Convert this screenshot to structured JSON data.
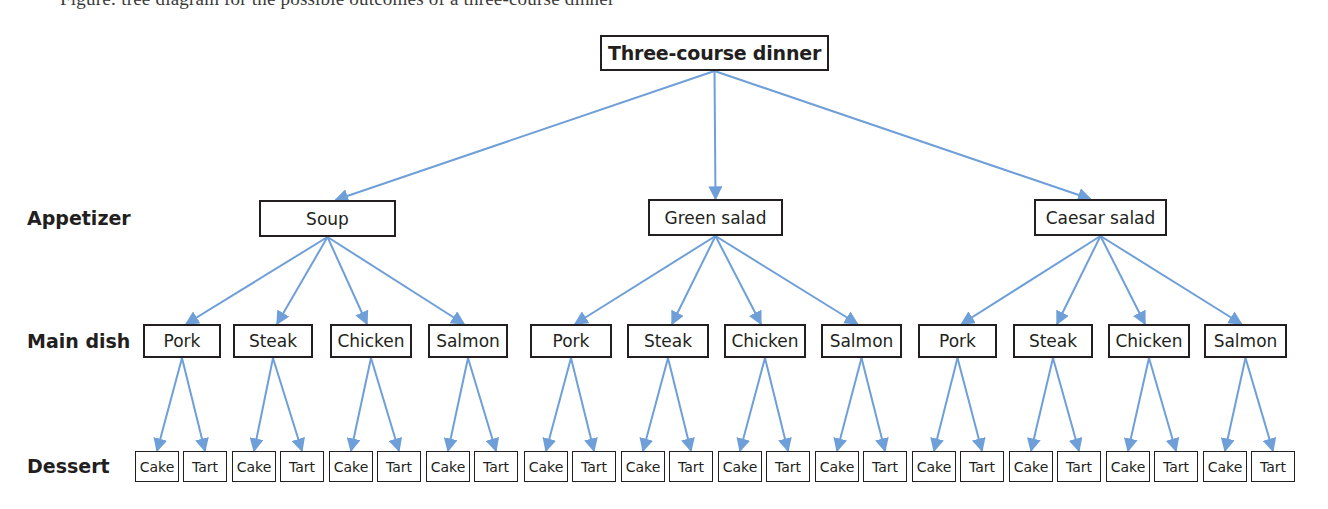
{
  "caption_cutoff": "Figure: tree diagram for the possible outcomes of a three-course dinner",
  "root": {
    "label": "Three-course dinner",
    "x": 600,
    "y": 35,
    "w": 229,
    "h": 36
  },
  "level_labels": [
    {
      "label": "Appetizer",
      "y": 218
    },
    {
      "label": "Main dish",
      "y": 341
    },
    {
      "label": "Dessert",
      "y": 466
    }
  ],
  "appetizers": [
    {
      "label": "Soup",
      "x": 259,
      "y": 200,
      "w": 137,
      "h": 37
    },
    {
      "label": "Green salad",
      "x": 648,
      "y": 199,
      "w": 135,
      "h": 37
    },
    {
      "label": "Caesar salad",
      "x": 1034,
      "y": 199,
      "w": 133,
      "h": 37
    }
  ],
  "main_dish_options": [
    "Pork",
    "Steak",
    "Chicken",
    "Salmon"
  ],
  "dessert_options": [
    "Cake",
    "Tart"
  ],
  "layout": {
    "main_y": 324,
    "main_h": 34,
    "main_boxes_x": [
      [
        143,
        78
      ],
      [
        233,
        80
      ],
      [
        330,
        82
      ],
      [
        428,
        80
      ],
      [
        530,
        82
      ],
      [
        627,
        82
      ],
      [
        724,
        82
      ],
      [
        821,
        81
      ],
      [
        918,
        79
      ],
      [
        1013,
        80
      ],
      [
        1108,
        82
      ],
      [
        1204,
        83
      ]
    ],
    "dessert_y": 451,
    "dessert_h": 31,
    "dessert_w": 44,
    "dessert_pair_x": [
      135,
      232,
      329,
      426,
      524,
      621,
      718,
      815,
      912,
      1009,
      1106,
      1203
    ],
    "tart_offset": 48
  },
  "colors": {
    "arrow": "#6f9fd8",
    "box_border": "#231f20",
    "text": "#231f20"
  }
}
